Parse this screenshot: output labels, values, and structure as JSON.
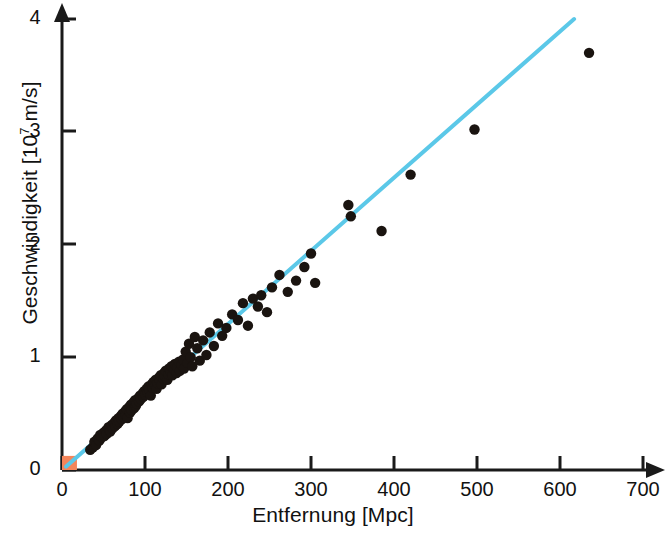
{
  "chart_data": {
    "type": "scatter",
    "title": "",
    "subtitle": "",
    "xlabel": "Entfernung [Mpc]",
    "ylabel": "Geschwindigkeit [10⁷ m/s]",
    "ylabel_base": "Geschwindigkeit [10",
    "ylabel_exp": "7",
    "ylabel_tail": " m/s]",
    "xlim": [
      0,
      700
    ],
    "ylim": [
      0,
      4
    ],
    "xticks": [
      0,
      100,
      200,
      300,
      400,
      500,
      600,
      700
    ],
    "yticks": [
      0,
      1,
      2,
      3,
      4
    ],
    "xtick_labels": [
      "0",
      "100",
      "200",
      "300",
      "400",
      "500",
      "600",
      "700"
    ],
    "ytick_labels": [
      "0",
      "1",
      "2",
      "3",
      "4"
    ],
    "grid": false,
    "legend": "none",
    "axis_style": "arrow-tipped open axes",
    "series": [
      {
        "name": "Galaxien",
        "type": "scatter",
        "marker": "circle",
        "color": "#1a1410",
        "points": [
          [
            34,
            0.18
          ],
          [
            37,
            0.2
          ],
          [
            39,
            0.25
          ],
          [
            41,
            0.22
          ],
          [
            43,
            0.28
          ],
          [
            45,
            0.26
          ],
          [
            46,
            0.31
          ],
          [
            48,
            0.29
          ],
          [
            50,
            0.33
          ],
          [
            51,
            0.3
          ],
          [
            53,
            0.35
          ],
          [
            54,
            0.32
          ],
          [
            56,
            0.38
          ],
          [
            57,
            0.36
          ],
          [
            58,
            0.34
          ],
          [
            60,
            0.4
          ],
          [
            61,
            0.37
          ],
          [
            63,
            0.42
          ],
          [
            64,
            0.39
          ],
          [
            65,
            0.44
          ],
          [
            67,
            0.41
          ],
          [
            68,
            0.46
          ],
          [
            69,
            0.43
          ],
          [
            71,
            0.48
          ],
          [
            72,
            0.45
          ],
          [
            73,
            0.5
          ],
          [
            74,
            0.47
          ],
          [
            76,
            0.52
          ],
          [
            77,
            0.49
          ],
          [
            78,
            0.54
          ],
          [
            79,
            0.46
          ],
          [
            81,
            0.56
          ],
          [
            82,
            0.51
          ],
          [
            83,
            0.58
          ],
          [
            84,
            0.53
          ],
          [
            86,
            0.6
          ],
          [
            87,
            0.55
          ],
          [
            88,
            0.62
          ],
          [
            89,
            0.57
          ],
          [
            90,
            0.59
          ],
          [
            92,
            0.64
          ],
          [
            93,
            0.61
          ],
          [
            94,
            0.66
          ],
          [
            95,
            0.63
          ],
          [
            97,
            0.68
          ],
          [
            98,
            0.65
          ],
          [
            99,
            0.7
          ],
          [
            100,
            0.67
          ],
          [
            102,
            0.72
          ],
          [
            103,
            0.69
          ],
          [
            104,
            0.74
          ],
          [
            105,
            0.71
          ],
          [
            107,
            0.66
          ],
          [
            108,
            0.76
          ],
          [
            109,
            0.73
          ],
          [
            110,
            0.78
          ],
          [
            112,
            0.75
          ],
          [
            113,
            0.8
          ],
          [
            114,
            0.72
          ],
          [
            115,
            0.77
          ],
          [
            117,
            0.82
          ],
          [
            118,
            0.79
          ],
          [
            119,
            0.84
          ],
          [
            120,
            0.76
          ],
          [
            122,
            0.81
          ],
          [
            123,
            0.86
          ],
          [
            124,
            0.83
          ],
          [
            125,
            0.88
          ],
          [
            127,
            0.8
          ],
          [
            128,
            0.85
          ],
          [
            129,
            0.9
          ],
          [
            131,
            0.87
          ],
          [
            132,
            0.92
          ],
          [
            133,
            0.84
          ],
          [
            135,
            0.89
          ],
          [
            136,
            0.94
          ],
          [
            138,
            0.86
          ],
          [
            139,
            0.91
          ],
          [
            141,
            0.96
          ],
          [
            142,
            0.88
          ],
          [
            144,
            0.93
          ],
          [
            146,
            0.98
          ],
          [
            147,
            0.9
          ],
          [
            149,
            1.05
          ],
          [
            151,
            0.95
          ],
          [
            153,
            1.12
          ],
          [
            155,
            1.0
          ],
          [
            157,
            0.92
          ],
          [
            160,
            1.18
          ],
          [
            163,
            1.08
          ],
          [
            166,
            0.97
          ],
          [
            170,
            1.15
          ],
          [
            174,
            1.02
          ],
          [
            178,
            1.22
          ],
          [
            183,
            1.1
          ],
          [
            188,
            1.3
          ],
          [
            193,
            1.19
          ],
          [
            198,
            1.26
          ],
          [
            205,
            1.38
          ],
          [
            212,
            1.33
          ],
          [
            218,
            1.48
          ],
          [
            224,
            1.28
          ],
          [
            230,
            1.52
          ],
          [
            236,
            1.45
          ],
          [
            240,
            1.55
          ],
          [
            247,
            1.4
          ],
          [
            253,
            1.62
          ],
          [
            262,
            1.73
          ],
          [
            272,
            1.58
          ],
          [
            282,
            1.68
          ],
          [
            292,
            1.8
          ],
          [
            300,
            1.92
          ],
          [
            305,
            1.66
          ],
          [
            345,
            2.35
          ],
          [
            348,
            2.25
          ],
          [
            385,
            2.12
          ],
          [
            420,
            2.62
          ],
          [
            497,
            3.02
          ],
          [
            635,
            3.7
          ]
        ]
      },
      {
        "name": "Hubble-Gerade",
        "type": "line",
        "color": "#5BC8E8",
        "from": [
          5,
          0.03
        ],
        "to": [
          617,
          4.0
        ],
        "slope_per_Mpc": 0.00649
      },
      {
        "name": "Lokale Gruppe",
        "type": "rect-marker",
        "color": "#F4855A",
        "x_range": [
          0,
          18
        ],
        "y_range": [
          0,
          0.125
        ]
      }
    ]
  },
  "axes": {
    "x_axis_name": "Entfernung",
    "y_axis_name": "Geschwindigkeit"
  }
}
